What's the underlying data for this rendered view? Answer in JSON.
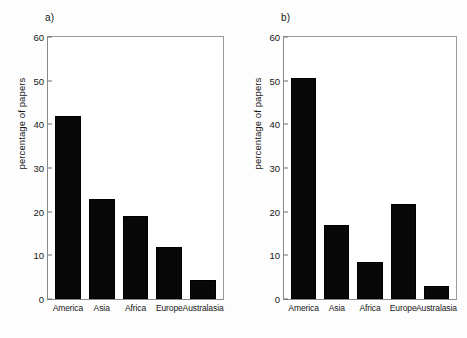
{
  "figure": {
    "background": "#ffffff",
    "bar_color": "#080808",
    "axis_color": "#8a8a8a"
  },
  "panels": [
    {
      "tag": "a)",
      "ylabel": "percentage of papers",
      "yticks": [
        "0",
        "10",
        "20",
        "30",
        "40",
        "50",
        "60"
      ],
      "categories": [
        "America",
        "Asia",
        "Africa",
        "Europe",
        "Australasia"
      ],
      "values": [
        42,
        23,
        19,
        12,
        4.3
      ]
    },
    {
      "tag": "b)",
      "ylabel": "percentage of papers",
      "yticks": [
        "0",
        "10",
        "20",
        "30",
        "40",
        "50",
        "60"
      ],
      "categories": [
        "America",
        "Asia",
        "Africa",
        "Europe",
        "Australasia"
      ],
      "values": [
        50.5,
        17,
        8.5,
        21.8,
        3
      ]
    }
  ],
  "chart_data": [
    {
      "type": "bar",
      "title": "a)",
      "categories": [
        "America",
        "Asia",
        "Africa",
        "Europe",
        "Australasia"
      ],
      "values": [
        42,
        23,
        19,
        12,
        4.3
      ],
      "xlabel": "",
      "ylabel": "percentage of papers",
      "ylim": [
        0,
        60
      ],
      "ytick_step": 10,
      "yticks": [
        0,
        10,
        20,
        30,
        40,
        50,
        60
      ],
      "grid": false,
      "legend": false,
      "bar_color": "#080808"
    },
    {
      "type": "bar",
      "title": "b)",
      "categories": [
        "America",
        "Asia",
        "Africa",
        "Europe",
        "Australasia"
      ],
      "values": [
        50.5,
        17,
        8.5,
        21.8,
        3
      ],
      "xlabel": "",
      "ylabel": "percentage of papers",
      "ylim": [
        0,
        60
      ],
      "ytick_step": 10,
      "yticks": [
        0,
        10,
        20,
        30,
        40,
        50,
        60
      ],
      "grid": false,
      "legend": false,
      "bar_color": "#080808"
    }
  ]
}
